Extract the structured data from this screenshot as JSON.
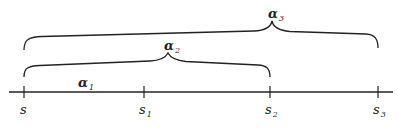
{
  "diagram": {
    "axis": {
      "points": [
        {
          "label": "s",
          "sub": "",
          "x": 24
        },
        {
          "label": "s",
          "sub": "1",
          "x": 144
        },
        {
          "label": "s",
          "sub": "2",
          "x": 270
        },
        {
          "label": "s",
          "sub": "3",
          "x": 378
        }
      ]
    },
    "intervals": [
      {
        "label": "α",
        "sub": "1",
        "from": "s",
        "to": "s1"
      },
      {
        "label": "α",
        "sub": "2",
        "from": "s",
        "to": "s2"
      },
      {
        "label": "α",
        "sub": "3",
        "from": "s",
        "to": "s3"
      }
    ],
    "colors": {
      "stroke": "#222222",
      "background": "#ffffff"
    }
  }
}
